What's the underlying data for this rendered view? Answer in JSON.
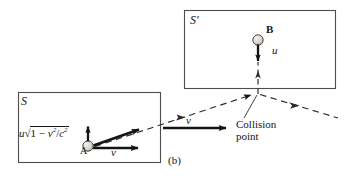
{
  "figure": {
    "panel_label": "(b)",
    "background_color": "#ffffff",
    "ink_color": "#141414",
    "frames": [
      {
        "id": "S",
        "label": "S",
        "box": [
          18,
          92,
          142,
          70
        ]
      },
      {
        "id": "S'",
        "label": "S′",
        "box": [
          184,
          10,
          151,
          78
        ]
      }
    ],
    "balls": [
      {
        "id": "A",
        "label": "A",
        "cx": 88,
        "cy": 146,
        "r": 5,
        "fill": "#d8d4cf"
      },
      {
        "id": "B",
        "label": "B",
        "cx": 258,
        "cy": 40,
        "r": 5,
        "fill": "#d8d4cf"
      }
    ],
    "labels": {
      "frame_S": "S",
      "frame_S_prime": "S′",
      "ball_A": "A",
      "ball_B": "B",
      "u_at_B": "u",
      "v_at_A": "v",
      "v_middle": "v",
      "collision_line1": "Collision",
      "collision_line2": "point",
      "expression_leading": "u",
      "expression_radical": "√",
      "expression_body_1": "1 − ",
      "expression_body_v": "v",
      "expression_body_sup1": "2",
      "expression_body_slash": "/",
      "expression_body_c": "c",
      "expression_body_sup2": "2",
      "expression_full": "u√(1 − v²/c²)"
    },
    "vectors": [
      {
        "name": "u-prime-at-A",
        "from": [
          88,
          141
        ],
        "to": [
          88,
          124
        ],
        "style": "solid-thick",
        "label": "u√(1 − v²/c²)"
      },
      {
        "name": "v-at-A",
        "from": [
          94,
          148
        ],
        "to": [
          139,
          148
        ],
        "style": "solid-thick",
        "label": "v"
      },
      {
        "name": "resultant-at-A",
        "from": [
          94,
          146
        ],
        "to": [
          140,
          129
        ],
        "style": "solid-thick",
        "label": ""
      },
      {
        "name": "v-middle",
        "from": [
          163,
          128
        ],
        "to": [
          228,
          128
        ],
        "style": "solid-thick",
        "label": "v"
      },
      {
        "name": "u-at-B",
        "from": [
          258,
          45
        ],
        "to": [
          258,
          63
        ],
        "style": "solid-thick",
        "label": "u"
      },
      {
        "name": "B-incoming-dashed",
        "from": [
          258,
          93
        ],
        "to": [
          258,
          66
        ],
        "style": "dashed",
        "label": ""
      },
      {
        "name": "A-trajectory-dashed",
        "from": [
          94,
          147
        ],
        "to": [
          258,
          93
        ],
        "style": "dashed",
        "label": ""
      },
      {
        "name": "outgoing-right-dashed",
        "from": [
          258,
          93
        ],
        "to": [
          337,
          118
        ],
        "style": "dashed",
        "label": ""
      }
    ],
    "collision_point": {
      "x": 258,
      "y": 93
    }
  }
}
